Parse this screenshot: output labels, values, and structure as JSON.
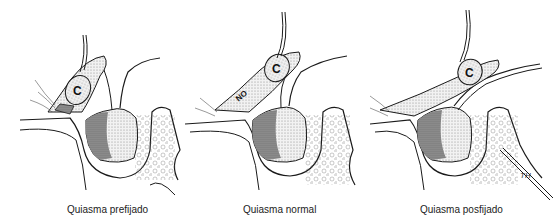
{
  "figure": {
    "panels": [
      {
        "id": "prefixed",
        "caption": "Quiasma prefijado",
        "labels": {
          "carotid": "C"
        }
      },
      {
        "id": "normal",
        "caption": "Quiasma normal",
        "labels": {
          "carotid": "C",
          "optic_nerve": "NO"
        }
      },
      {
        "id": "postfixed",
        "caption": "Quiasma posfijado",
        "labels": {
          "carotid": "C"
        },
        "signature": "TH"
      }
    ]
  },
  "colors": {
    "line": "#1a1a1a",
    "dark_stipple": "#8a8a8a",
    "light_stipple": "#d6d6d6",
    "background": "#ffffff"
  }
}
